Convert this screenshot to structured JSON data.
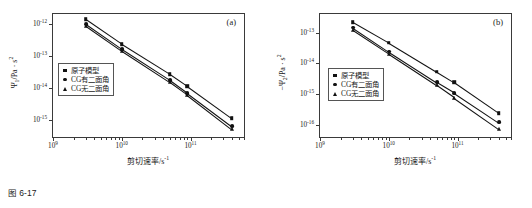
{
  "figure": {
    "caption": "图 6-17"
  },
  "panels": [
    {
      "label": "(a)",
      "xlabel": "剪切速率/s",
      "xlabel_exp": "-1",
      "ylabel_prefix": "",
      "ylabel_symbol": "Ψ",
      "ylabel_sub": "1",
      "ylabel_unit": "/Pa · s",
      "ylabel_unit_exp": "2",
      "xticks": [
        "10",
        "10",
        "10"
      ],
      "xtick_exps": [
        "9",
        "10",
        "11"
      ],
      "yticks": [
        "10",
        "10",
        "10",
        "10"
      ],
      "ytick_exps": [
        "-12",
        "-13",
        "-14",
        "-15"
      ],
      "legend": [
        {
          "key": "square",
          "label": "原子模型"
        },
        {
          "key": "circle",
          "label": "CG有二面角"
        },
        {
          "key": "triangle",
          "label": "CG无二面角"
        }
      ]
    },
    {
      "label": "(b)",
      "xlabel": "剪切速率/s",
      "xlabel_exp": "-1",
      "ylabel_prefix": "−",
      "ylabel_symbol": "Ψ",
      "ylabel_sub": "2",
      "ylabel_unit": "/Pa · s",
      "ylabel_unit_exp": "2",
      "xticks": [
        "10",
        "10",
        "10"
      ],
      "xtick_exps": [
        "9",
        "10",
        "11"
      ],
      "yticks": [
        "10",
        "10",
        "10",
        "10"
      ],
      "ytick_exps": [
        "-13",
        "-14",
        "-15",
        "-16"
      ],
      "legend": [
        {
          "key": "square",
          "label": "原子模型"
        },
        {
          "key": "circle",
          "label": "CG有二面角"
        },
        {
          "key": "triangle",
          "label": "CG无二面角"
        }
      ]
    }
  ],
  "chart_data": [
    {
      "type": "scatter",
      "panel": "(a)",
      "title": "",
      "xlabel": "剪切速率/s^-1",
      "ylabel": "Ψ1/Pa·s^2",
      "xscale": "log",
      "yscale": "log",
      "xlim": [
        1000000000.0,
        600000000000.0
      ],
      "ylim": [
        3e-16,
        2e-12
      ],
      "xticks": [
        1000000000.0,
        10000000000.0,
        100000000000.0
      ],
      "yticks": [
        1e-12,
        1e-13,
        1e-14,
        1e-15
      ],
      "grid": false,
      "legend_position": "lower-left-inside",
      "x": [
        3000000000.0,
        10000000000.0,
        50000000000.0,
        90000000000.0,
        400000000000.0
      ],
      "series": [
        {
          "name": "原子模型",
          "marker": "square",
          "values": [
            1.35e-12,
            2.3e-13,
            2.7e-14,
            1.15e-14,
            1.15e-15
          ]
        },
        {
          "name": "CG有二面角",
          "marker": "circle",
          "values": [
            9.5e-13,
            1.6e-13,
            1.75e-14,
            7e-15,
            6.5e-16
          ]
        },
        {
          "name": "CG无二面角",
          "marker": "triangle",
          "values": [
            8.5e-13,
            1.42e-13,
            1.52e-14,
            6.2e-15,
            5.3e-16
          ]
        }
      ]
    },
    {
      "type": "scatter",
      "panel": "(b)",
      "title": "",
      "xlabel": "剪切速率/s^-1",
      "ylabel": "-Ψ2/Pa·s^2",
      "xscale": "log",
      "yscale": "log",
      "xlim": [
        1000000000.0,
        600000000000.0
      ],
      "ylim": [
        4e-17,
        4e-13
      ],
      "xticks": [
        1000000000.0,
        10000000000.0,
        100000000000.0
      ],
      "yticks": [
        1e-13,
        1e-14,
        1e-15,
        1e-16
      ],
      "grid": false,
      "legend_position": "lower-left-inside",
      "x": [
        3000000000.0,
        10000000000.0,
        50000000000.0,
        90000000000.0,
        400000000000.0
      ],
      "series": [
        {
          "name": "原子模型",
          "marker": "square",
          "values": [
            2.2e-13,
            4.7e-14,
            5.3e-15,
            2.4e-15,
            2.4e-16
          ]
        },
        {
          "name": "CG有二面角",
          "marker": "circle",
          "values": [
            1.45e-13,
            2.4e-14,
            2.4e-15,
            1.1e-15,
            1.2e-16
          ]
        },
        {
          "name": "CG无二面角",
          "marker": "triangle",
          "values": [
            1.18e-13,
            2e-14,
            1.9e-15,
            7.6e-16,
            7.4e-17
          ]
        }
      ]
    }
  ]
}
